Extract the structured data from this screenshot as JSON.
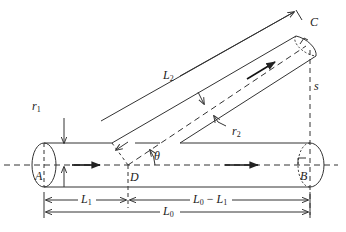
{
  "diagram": {
    "colors": {
      "line": "#333333",
      "background": "#ffffff"
    },
    "points": {
      "A": "A",
      "B": "B",
      "C": "C",
      "D": "D"
    },
    "labels": {
      "r1": {
        "main": "r",
        "sub": "1"
      },
      "r2": {
        "main": "r",
        "sub": "2"
      },
      "L1": {
        "main": "L",
        "sub": "1"
      },
      "L2": {
        "main": "L",
        "sub": "2"
      },
      "L0": {
        "main": "L",
        "sub": "0"
      },
      "L0_minus_L1": {
        "main1": "L",
        "sub1": "0",
        "minus": " − ",
        "main2": "L",
        "sub2": "1"
      },
      "theta": "θ",
      "s": "s"
    },
    "elements": [
      "main-pipe (A to B, radius r1)",
      "branch-pipe (D to C, radius r2, angle theta)",
      "flow arrows",
      "dimension lines L1, L0-L1, L0, L2, s"
    ]
  }
}
